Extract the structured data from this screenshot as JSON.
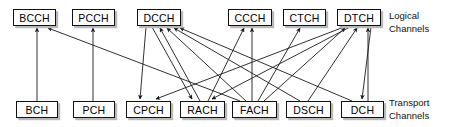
{
  "diagram": {
    "side_labels": {
      "logical": "Logical\nChannels",
      "transport": "Transport\nChannels"
    },
    "style": {
      "box_fill": "#ffffff",
      "box_stroke": "#111111",
      "box_shadow": "#b9b9b9",
      "line_color": "#1a1a1a",
      "background": "#ffffff"
    },
    "logical_channels": [
      {
        "id": "BCCH",
        "label": "BCCH",
        "x": 13,
        "y": 9,
        "w": 43,
        "h": 17
      },
      {
        "id": "PCCH",
        "label": "PCCH",
        "x": 72,
        "y": 9,
        "w": 43,
        "h": 17
      },
      {
        "id": "DCCH",
        "label": "DCCH",
        "x": 137,
        "y": 9,
        "w": 44,
        "h": 17
      },
      {
        "id": "CCCH",
        "label": "CCCH",
        "x": 228,
        "y": 9,
        "w": 44,
        "h": 17
      },
      {
        "id": "CTCH",
        "label": "CTCH",
        "x": 283,
        "y": 9,
        "w": 43,
        "h": 17
      },
      {
        "id": "DTCH",
        "label": "DTCH",
        "x": 337,
        "y": 9,
        "w": 44,
        "h": 17
      }
    ],
    "transport_channels": [
      {
        "id": "BCH",
        "label": "BCH",
        "x": 16,
        "y": 101,
        "w": 42,
        "h": 17
      },
      {
        "id": "PCH",
        "label": "PCH",
        "x": 73,
        "y": 101,
        "w": 42,
        "h": 17
      },
      {
        "id": "CPCH",
        "label": "CPCH",
        "x": 126,
        "y": 101,
        "w": 45,
        "h": 17
      },
      {
        "id": "RACH",
        "label": "RACH",
        "x": 180,
        "y": 101,
        "w": 45,
        "h": 17
      },
      {
        "id": "FACH",
        "label": "FACH",
        "x": 232,
        "y": 101,
        "w": 45,
        "h": 17
      },
      {
        "id": "DSCH",
        "label": "DSCH",
        "x": 286,
        "y": 101,
        "w": 45,
        "h": 17
      },
      {
        "id": "DCH",
        "label": "DCH",
        "x": 341,
        "y": 101,
        "w": 43,
        "h": 17
      }
    ],
    "connections": [
      {
        "from": "BCH",
        "to": "BCCH",
        "fx": 37,
        "fy": 101,
        "tx": 37,
        "ty": 28
      },
      {
        "from": "FACH",
        "to": "BCCH",
        "fx": 240,
        "fy": 101,
        "tx": 48,
        "ty": 28
      },
      {
        "from": "PCH",
        "to": "PCCH",
        "fx": 93,
        "fy": 101,
        "tx": 93,
        "ty": 28
      },
      {
        "from": "DCCH",
        "to": "CPCH",
        "fx": 146,
        "fy": 27,
        "tx": 140,
        "ty": 99
      },
      {
        "from": "DCCH",
        "to": "RACH",
        "fx": 152,
        "fy": 27,
        "tx": 192,
        "ty": 99
      },
      {
        "from": "RACH",
        "to": "DCCH",
        "fx": 200,
        "fy": 101,
        "tx": 160,
        "ty": 28
      },
      {
        "from": "FACH",
        "to": "DCCH",
        "fx": 246,
        "fy": 101,
        "tx": 167,
        "ty": 28
      },
      {
        "from": "DSCH",
        "to": "DCCH",
        "fx": 300,
        "fy": 101,
        "tx": 174,
        "ty": 28
      },
      {
        "from": "DCH",
        "to": "DCCH",
        "fx": 352,
        "fy": 101,
        "tx": 180,
        "ty": 28
      },
      {
        "from": "RACH",
        "to": "CCCH",
        "fx": 208,
        "fy": 101,
        "tx": 244,
        "ty": 28
      },
      {
        "from": "FACH",
        "to": "CCCH",
        "fx": 252,
        "fy": 101,
        "tx": 252,
        "ty": 28
      },
      {
        "from": "FACH",
        "to": "CTCH",
        "fx": 258,
        "fy": 101,
        "tx": 300,
        "ty": 28
      },
      {
        "from": "DTCH",
        "to": "CPCH",
        "fx": 344,
        "fy": 27,
        "tx": 156,
        "ty": 99
      },
      {
        "from": "DTCH",
        "to": "RACH",
        "fx": 350,
        "fy": 27,
        "tx": 212,
        "ty": 99
      },
      {
        "from": "FACH",
        "to": "DTCH",
        "fx": 264,
        "fy": 101,
        "tx": 345,
        "ty": 28
      },
      {
        "from": "DSCH",
        "to": "DTCH",
        "fx": 308,
        "fy": 101,
        "tx": 357,
        "ty": 28
      },
      {
        "from": "DTCH",
        "to": "DCH",
        "fx": 371,
        "fy": 27,
        "tx": 362,
        "ty": 99
      },
      {
        "from": "DCH",
        "to": "DTCH",
        "fx": 368,
        "fy": 101,
        "tx": 368,
        "ty": 28
      }
    ]
  }
}
